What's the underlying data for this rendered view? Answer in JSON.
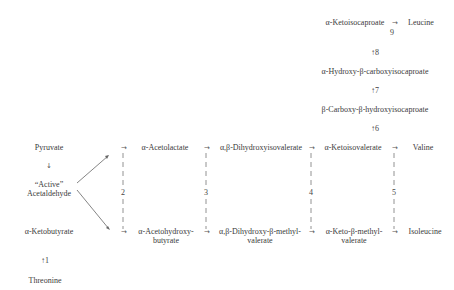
{
  "leucine_branch": {
    "ketoisocaproate": "α-Ketoisocaproate",
    "arrow_right": "→",
    "leucine": "Leucine",
    "step9": "9",
    "step8": "↑8",
    "hydroxy_carboxy": "α-Hydroxy-β-carboxyisocaproate",
    "step7": "↑7",
    "carboxy_hydroxy": "β-Carboxy-β-hydroxyisocaproate",
    "step6": "↑6"
  },
  "left_column": {
    "pyruvate": "Pyruvate",
    "down_arrow": "↓",
    "active_line1": "“Active”",
    "active_line2": "Acetaldehyde",
    "ketobutyrate": "α-Ketobutyrate",
    "step1": "↑1",
    "threonine": "Threonine"
  },
  "top_row": {
    "arrow": "→",
    "acetolactate": "α-Acetolactate",
    "dihydroxyisovalerate": "α,β-Dihydroxyisovalerate",
    "ketoisovalerate": "α-Ketoisovalerate",
    "valine": "Valine"
  },
  "bottom_row": {
    "arrow": "→",
    "acetohydroxy_1": "α-Acetohydroxy-",
    "acetohydroxy_2": "butyrate",
    "dihydroxy_methyl_1": "α,β-Dihydroxy-β-methyl-",
    "dihydroxy_methyl_2": "valerate",
    "keto_methyl_1": "α-Keto-β-methyl-",
    "keto_methyl_2": "valerate",
    "isoleucine": "Isoleucine"
  },
  "enzyme_steps": [
    "2",
    "3",
    "4",
    "5"
  ],
  "colors": {
    "text": "#3a3a3a",
    "line": "#555555",
    "background": "#ffffff"
  }
}
